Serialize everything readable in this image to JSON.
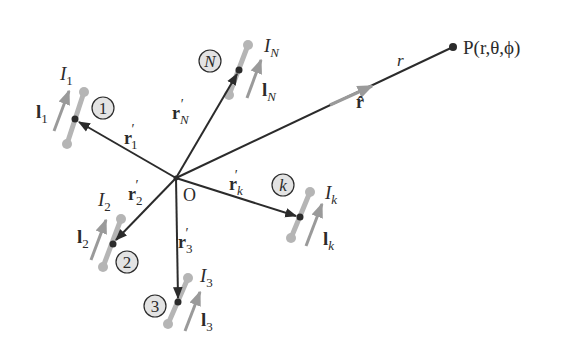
{
  "origin": {
    "label": "O"
  },
  "point": {
    "label": "P(r,θ,ϕ)",
    "distance_label": "r",
    "unit_vector_label": "r̂"
  },
  "elements": [
    {
      "id": "1",
      "current": "I",
      "current_sub": "1",
      "length": "l",
      "length_sub": "1",
      "position": "r",
      "position_sub": "1",
      "prime": "′"
    },
    {
      "id": "N",
      "current": "I",
      "current_sub": "N",
      "length": "l",
      "length_sub": "N",
      "position": "r",
      "position_sub": "N",
      "prime": "′"
    },
    {
      "id": "k",
      "current": "I",
      "current_sub": "k",
      "length": "l",
      "length_sub": "k",
      "position": "r",
      "position_sub": "k",
      "prime": "′"
    },
    {
      "id": "2",
      "current": "I",
      "current_sub": "2",
      "length": "l",
      "length_sub": "2",
      "position": "r",
      "position_sub": "2",
      "prime": "′"
    },
    {
      "id": "3",
      "current": "I",
      "current_sub": "3",
      "length": "l",
      "length_sub": "3",
      "position": "r",
      "position_sub": "3",
      "prime": "′"
    }
  ],
  "colors": {
    "line": "#2b2b2b",
    "element": "#b5b5b5",
    "arrow": "#9a9a9a",
    "circle_fill": "#e3e3e3"
  }
}
